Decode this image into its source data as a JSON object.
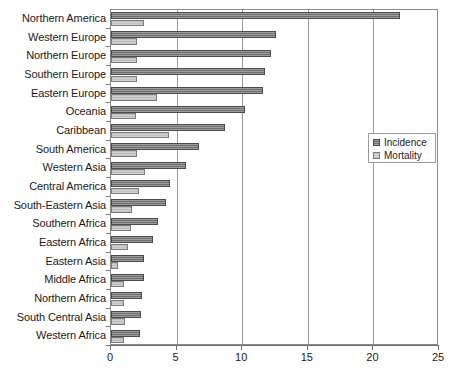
{
  "chart_data": {
    "type": "bar",
    "orientation": "horizontal",
    "title": "",
    "xlabel": "",
    "ylabel": "",
    "xlim": [
      0,
      25
    ],
    "xticks": [
      0,
      5,
      10,
      15,
      20,
      25
    ],
    "grid": true,
    "legend_position": "right",
    "categories": [
      "Northern America",
      "Western Europe",
      "Northern Europe",
      "Southern Europe",
      "Eastern Europe",
      "Oceania",
      "Caribbean",
      "South America",
      "Western Asia",
      "Central America",
      "South-Eastern Asia",
      "Southern Africa",
      "Eastern Africa",
      "Eastern Asia",
      "Middle Africa",
      "Northern Africa",
      "South Central Asia",
      "Western Africa"
    ],
    "series": [
      {
        "name": "Incidence",
        "color": "#6e6e6e",
        "values": [
          22.0,
          12.6,
          12.2,
          11.7,
          11.6,
          10.2,
          8.7,
          6.7,
          5.7,
          4.5,
          4.2,
          3.6,
          3.2,
          2.5,
          2.5,
          2.4,
          2.3,
          2.2
        ]
      },
      {
        "name": "Mortality",
        "color": "#d2d2d2",
        "values": [
          2.5,
          2.0,
          2.0,
          2.0,
          3.5,
          1.9,
          4.4,
          2.0,
          2.6,
          2.1,
          1.6,
          1.5,
          1.3,
          0.5,
          1.0,
          1.0,
          1.1,
          1.0
        ]
      }
    ]
  },
  "legend": {
    "items": [
      {
        "label": "Incidence",
        "swatch": "incidence-swatch-icon"
      },
      {
        "label": "Mortality",
        "swatch": "mortality-swatch-icon"
      }
    ]
  }
}
